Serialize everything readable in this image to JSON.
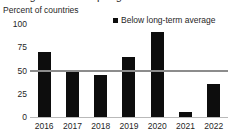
{
  "title_fragment": "Agricultural output growth",
  "axis_title": "Percent of countries",
  "legend": {
    "marker": "filled-square-marker",
    "label": "Below long-term average"
  },
  "chart_data": {
    "type": "bar",
    "title": "",
    "xlabel": "",
    "ylabel": "Percent of countries",
    "categories": [
      "2016",
      "2017",
      "2018",
      "2019",
      "2020",
      "2021",
      "2022"
    ],
    "series": [
      {
        "name": "Below long-term average",
        "color": "#0d0d0d",
        "values": [
          70,
          50,
          45,
          65,
          91,
          5,
          35
        ]
      }
    ],
    "ylim": [
      0,
      100
    ],
    "yticks": [
      "100",
      "75",
      "50",
      "25",
      "0"
    ],
    "ytick_values": [
      100,
      75,
      50,
      25,
      0
    ],
    "grid": false,
    "legend_position": "top-right",
    "reference_line": {
      "label": "50 percent reference line",
      "value": 50,
      "color": "#8c8c8c"
    }
  }
}
